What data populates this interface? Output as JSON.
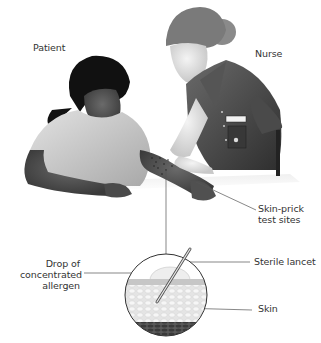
{
  "diagram": {
    "colors": {
      "background": "#ffffff",
      "label_text": "#333333",
      "leader_line": "#555555",
      "skin_dark": "#4a4a4a",
      "uniform": "#3c3c3c",
      "hair": "#111111"
    },
    "figures": [
      {
        "id": "patient",
        "label": "Patient"
      },
      {
        "id": "nurse",
        "label": "Nurse"
      }
    ],
    "labels": {
      "patient": "Patient",
      "nurse": "Nurse",
      "test_sites": "Skin-prick\ntest sites",
      "drop": "Drop of\nconcentrated\nallergen",
      "lancet": "Sterile lancet",
      "skin": "Skin"
    },
    "inset": {
      "description": "Magnified cross-section of skin with lancet pricking through allergen drop",
      "layers": [
        "allergen drop",
        "skin surface",
        "epidermis cells",
        "dermis"
      ]
    }
  }
}
